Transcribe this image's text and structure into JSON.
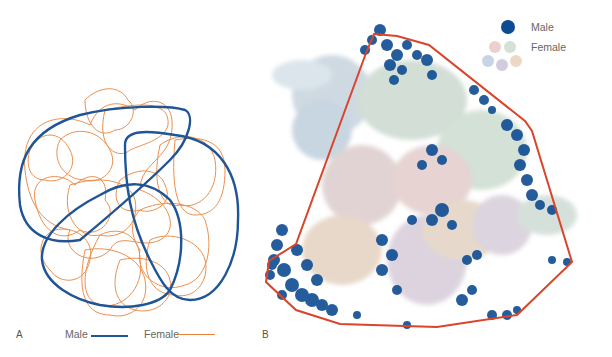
{
  "figure": {
    "panel_a": {
      "label": "A",
      "legend": [
        {
          "name": "Male",
          "color": "#1f5496"
        },
        {
          "name": "Female",
          "color": "#e8833a"
        }
      ]
    },
    "panel_b": {
      "label": "B",
      "legend": [
        {
          "name": "Male",
          "color": "#0e4c92"
        },
        {
          "name": "Female",
          "colors": [
            "#e3c6c6",
            "#c9d9cc",
            "#b9c9e0",
            "#c7bfd6",
            "#e6cfb8"
          ]
        }
      ],
      "hull_color": "#d9452b"
    }
  }
}
